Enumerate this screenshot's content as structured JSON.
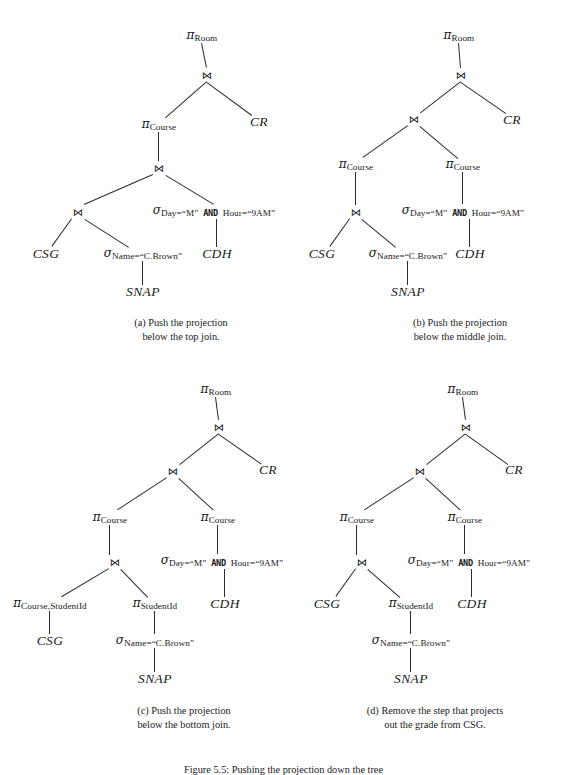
{
  "figure": {
    "caption": "Figure 5.5: Pushing the projection down the tree",
    "symbols": {
      "pi": "π",
      "sigma": "σ",
      "join": "⋈"
    },
    "panels": [
      {
        "id": "a",
        "caption": "(a) Push the projection\nbelow the top join.",
        "nodes": [
          {
            "name": "pi-room",
            "kind": "op",
            "glyph": "π",
            "sub": "Room",
            "x": 202,
            "y": 36
          },
          {
            "name": "join-top",
            "kind": "join",
            "label": "⋈",
            "x": 207,
            "y": 75
          },
          {
            "name": "pi-course",
            "kind": "op",
            "glyph": "π",
            "sub": "Course",
            "x": 159,
            "y": 125
          },
          {
            "name": "relation-cr",
            "kind": "rel",
            "label": "CR",
            "x": 259,
            "y": 122
          },
          {
            "name": "join-middle",
            "kind": "join",
            "label": "⋈",
            "x": 159,
            "y": 168
          },
          {
            "name": "join-bottom",
            "kind": "join",
            "label": "⋈",
            "x": 78,
            "y": 212
          },
          {
            "name": "sigma-day-hour",
            "kind": "op2",
            "glyph": "σ",
            "sub1": "Day=“M”",
            "kw": "AND",
            "sub2": "Hour=“9AM”",
            "x": 214,
            "y": 211
          },
          {
            "name": "relation-csg",
            "kind": "rel",
            "label": "CSG",
            "x": 46,
            "y": 254
          },
          {
            "name": "sigma-name",
            "kind": "op",
            "glyph": "σ",
            "sub": "Name=“C.Brown”",
            "x": 143,
            "y": 254
          },
          {
            "name": "relation-cdh",
            "kind": "rel",
            "label": "CDH",
            "x": 217,
            "y": 254
          },
          {
            "name": "relation-snap",
            "kind": "rel",
            "label": "SNAP",
            "x": 143,
            "y": 292
          }
        ],
        "edges": [
          [
            202,
            43,
            207,
            68
          ],
          [
            207,
            82,
            166,
            118
          ],
          [
            207,
            82,
            252,
            115
          ],
          [
            159,
            132,
            159,
            161
          ],
          [
            153,
            175,
            84,
            205
          ],
          [
            166,
            175,
            214,
            204
          ],
          [
            72,
            219,
            52,
            247
          ],
          [
            85,
            219,
            129,
            247
          ],
          [
            217,
            219,
            217,
            247
          ],
          [
            143,
            261,
            143,
            285
          ]
        ],
        "captionBox": {
          "x": 86,
          "y": 316,
          "w": 190
        }
      },
      {
        "id": "b",
        "caption": "(b) Push the projection\nbelow the middle join.",
        "nodes": [
          {
            "name": "pi-room",
            "kind": "op",
            "glyph": "π",
            "sub": "Room",
            "x": 459,
            "y": 36
          },
          {
            "name": "join-top",
            "kind": "join",
            "label": "⋈",
            "x": 461,
            "y": 75
          },
          {
            "name": "join-middle",
            "kind": "join",
            "label": "⋈",
            "x": 414,
            "y": 119
          },
          {
            "name": "relation-cr",
            "kind": "rel",
            "label": "CR",
            "x": 512,
            "y": 120
          },
          {
            "name": "pi-course-left",
            "kind": "op",
            "glyph": "π",
            "sub": "Course",
            "x": 356,
            "y": 165
          },
          {
            "name": "pi-course-right",
            "kind": "op",
            "glyph": "π",
            "sub": "Course",
            "x": 463,
            "y": 165
          },
          {
            "name": "join-bottom",
            "kind": "join",
            "label": "⋈",
            "x": 356,
            "y": 212
          },
          {
            "name": "sigma-day-hour",
            "kind": "op2",
            "glyph": "σ",
            "sub1": "Day=“M”",
            "kw": "AND",
            "sub2": "Hour=“9AM”",
            "x": 463,
            "y": 211
          },
          {
            "name": "relation-csg",
            "kind": "rel",
            "label": "CSG",
            "x": 322,
            "y": 254
          },
          {
            "name": "sigma-name",
            "kind": "op",
            "glyph": "σ",
            "sub": "Name=“C.Brown”",
            "x": 408,
            "y": 254
          },
          {
            "name": "relation-cdh",
            "kind": "rel",
            "label": "CDH",
            "x": 470,
            "y": 254
          },
          {
            "name": "relation-snap",
            "kind": "rel",
            "label": "SNAP",
            "x": 408,
            "y": 292
          }
        ],
        "edges": [
          [
            459,
            43,
            461,
            68
          ],
          [
            461,
            82,
            421,
            113
          ],
          [
            461,
            82,
            506,
            113
          ],
          [
            408,
            126,
            363,
            158
          ],
          [
            420,
            126,
            458,
            158
          ],
          [
            356,
            172,
            356,
            205
          ],
          [
            350,
            219,
            330,
            247
          ],
          [
            362,
            219,
            396,
            247
          ],
          [
            463,
            172,
            463,
            204
          ],
          [
            470,
            219,
            470,
            247
          ],
          [
            408,
            261,
            408,
            285
          ]
        ],
        "captionBox": {
          "x": 362,
          "y": 316,
          "w": 196
        }
      },
      {
        "id": "c",
        "caption": "(c) Push the projection\nbelow the bottom join.",
        "nodes": [
          {
            "name": "pi-room",
            "kind": "op",
            "glyph": "π",
            "sub": "Room",
            "x": 216,
            "y": 390
          },
          {
            "name": "join-top",
            "kind": "join",
            "label": "⋈",
            "x": 219,
            "y": 427
          },
          {
            "name": "join-middle",
            "kind": "join",
            "label": "⋈",
            "x": 173,
            "y": 471
          },
          {
            "name": "relation-cr",
            "kind": "rel",
            "label": "CR",
            "x": 268,
            "y": 470
          },
          {
            "name": "pi-course-left",
            "kind": "op",
            "glyph": "π",
            "sub": "Course",
            "x": 110,
            "y": 518
          },
          {
            "name": "pi-course-right",
            "kind": "op",
            "glyph": "π",
            "sub": "Course",
            "x": 218,
            "y": 518
          },
          {
            "name": "join-bottom",
            "kind": "join",
            "label": "⋈",
            "x": 115,
            "y": 562
          },
          {
            "name": "sigma-day-hour",
            "kind": "op2",
            "glyph": "σ",
            "sub1": "Day=“M”",
            "kw": "AND",
            "sub2": "Hour=“9AM”",
            "x": 222,
            "y": 561
          },
          {
            "name": "pi-course-student",
            "kind": "op",
            "glyph": "π",
            "sub": "Course,StudentId",
            "x": 50,
            "y": 604
          },
          {
            "name": "pi-studentid",
            "kind": "op",
            "glyph": "π",
            "sub": "StudentId",
            "x": 155,
            "y": 604
          },
          {
            "name": "relation-cdh",
            "kind": "rel",
            "label": "CDH",
            "x": 225,
            "y": 604
          },
          {
            "name": "relation-csg",
            "kind": "rel",
            "label": "CSG",
            "x": 50,
            "y": 641
          },
          {
            "name": "sigma-name",
            "kind": "op",
            "glyph": "σ",
            "sub": "Name=“C.Brown”",
            "x": 155,
            "y": 641
          },
          {
            "name": "relation-snap",
            "kind": "rel",
            "label": "SNAP",
            "x": 155,
            "y": 679
          }
        ],
        "edges": [
          [
            216,
            397,
            219,
            420
          ],
          [
            219,
            434,
            180,
            465
          ],
          [
            219,
            434,
            262,
            464
          ],
          [
            167,
            478,
            118,
            510
          ],
          [
            179,
            478,
            214,
            510
          ],
          [
            110,
            525,
            110,
            555
          ],
          [
            109,
            569,
            62,
            597
          ],
          [
            121,
            569,
            148,
            597
          ],
          [
            218,
            525,
            218,
            554
          ],
          [
            225,
            569,
            225,
            597
          ],
          [
            50,
            611,
            50,
            634
          ],
          [
            155,
            611,
            155,
            634
          ],
          [
            155,
            648,
            155,
            672
          ]
        ],
        "captionBox": {
          "x": 86,
          "y": 704,
          "w": 196
        }
      },
      {
        "id": "d",
        "caption": "(d) Remove the step that projects\nout the grade from CSG.",
        "nodes": [
          {
            "name": "pi-room",
            "kind": "op",
            "glyph": "π",
            "sub": "Room",
            "x": 463,
            "y": 390
          },
          {
            "name": "join-top",
            "kind": "join",
            "label": "⋈",
            "x": 466,
            "y": 427
          },
          {
            "name": "join-middle",
            "kind": "join",
            "label": "⋈",
            "x": 420,
            "y": 471
          },
          {
            "name": "relation-cr",
            "kind": "rel",
            "label": "CR",
            "x": 514,
            "y": 470
          },
          {
            "name": "pi-course-left",
            "kind": "op",
            "glyph": "π",
            "sub": "Course",
            "x": 357,
            "y": 518
          },
          {
            "name": "pi-course-right",
            "kind": "op",
            "glyph": "π",
            "sub": "Course",
            "x": 465,
            "y": 518
          },
          {
            "name": "join-bottom",
            "kind": "join",
            "label": "⋈",
            "x": 362,
            "y": 562
          },
          {
            "name": "sigma-day-hour",
            "kind": "op2",
            "glyph": "σ",
            "sub1": "Day=“M”",
            "kw": "AND",
            "sub2": "Hour=“9AM”",
            "x": 469,
            "y": 561
          },
          {
            "name": "relation-csg",
            "kind": "rel",
            "label": "CSG",
            "x": 327,
            "y": 604
          },
          {
            "name": "pi-studentid",
            "kind": "op",
            "glyph": "π",
            "sub": "StudentId",
            "x": 411,
            "y": 604
          },
          {
            "name": "relation-cdh",
            "kind": "rel",
            "label": "CDH",
            "x": 472,
            "y": 604
          },
          {
            "name": "sigma-name",
            "kind": "op",
            "glyph": "σ",
            "sub": "Name=“C.Brown”",
            "x": 411,
            "y": 641
          },
          {
            "name": "relation-snap",
            "kind": "rel",
            "label": "SNAP",
            "x": 411,
            "y": 679
          }
        ],
        "edges": [
          [
            463,
            397,
            466,
            420
          ],
          [
            466,
            434,
            427,
            465
          ],
          [
            466,
            434,
            508,
            464
          ],
          [
            414,
            478,
            365,
            510
          ],
          [
            426,
            478,
            461,
            510
          ],
          [
            357,
            525,
            357,
            555
          ],
          [
            356,
            569,
            336,
            597
          ],
          [
            368,
            569,
            400,
            597
          ],
          [
            465,
            525,
            465,
            554
          ],
          [
            472,
            569,
            472,
            597
          ],
          [
            411,
            611,
            411,
            634
          ],
          [
            411,
            648,
            411,
            672
          ]
        ],
        "captionBox": {
          "x": 330,
          "y": 704,
          "w": 210
        }
      }
    ]
  }
}
